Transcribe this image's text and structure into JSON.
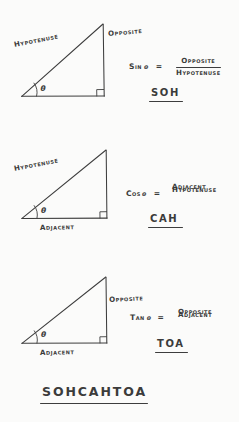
{
  "document": {
    "type": "handwritten-note",
    "subject": "Right triangle trigonometry ratios (SOHCAHTOA)",
    "ink_color": "#3b3b3b",
    "paper_color": "#fbfbfa"
  },
  "sections": [
    {
      "id": "sine",
      "triangle": {
        "labels": {
          "hypotenuse": "Hypotenuse",
          "opposite": "Opposite",
          "adjacent": "",
          "angle": "θ"
        },
        "right_angle_marker": true,
        "angle_arc": true
      },
      "equation": {
        "function": "Sin",
        "angle": "θ",
        "equals": "=",
        "numerator": "Opposite",
        "denominator": "Hypotenuse"
      },
      "mnemonic": "SOH"
    },
    {
      "id": "cosine",
      "triangle": {
        "labels": {
          "hypotenuse": "Hypotenuse",
          "opposite": "",
          "adjacent": "Adjacent",
          "angle": "θ"
        },
        "right_angle_marker": true,
        "angle_arc": true
      },
      "equation": {
        "function": "Cos",
        "angle": "θ",
        "equals": "=",
        "numerator": "Adjacent",
        "denominator": "Hypotenuse"
      },
      "mnemonic": "CAH"
    },
    {
      "id": "tangent",
      "triangle": {
        "labels": {
          "hypotenuse": "",
          "opposite": "Opposite",
          "adjacent": "Adjacent",
          "angle": "θ"
        },
        "right_angle_marker": true,
        "angle_arc": true
      },
      "equation": {
        "function": "Tan",
        "angle": "θ",
        "equals": "=",
        "numerator": "Opposite",
        "denominator": "Adjacent"
      },
      "mnemonic": "TOA"
    }
  ],
  "footer": {
    "mnemonic": "SOHCAHTOA",
    "underlined": true
  }
}
